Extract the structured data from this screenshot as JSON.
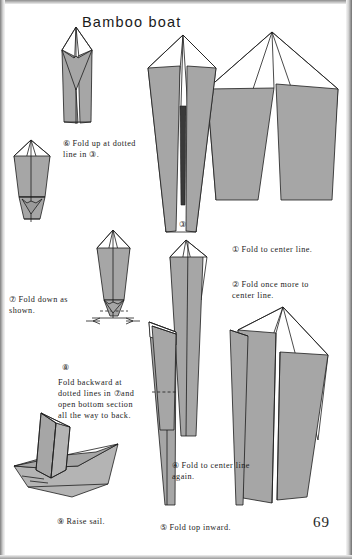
{
  "page": {
    "title": "Bamboo boat",
    "page_number": "69",
    "background_color": "#ffffff",
    "ink_color": "#1b1b1b",
    "paper_fill": "#a6a6a6"
  },
  "steps": [
    {
      "id": "1",
      "marker": "①",
      "label": "Fold to center line.",
      "caption_x": 232,
      "caption_y": 233
    },
    {
      "id": "2",
      "marker": "②",
      "label": "Fold once more to\n      center line.",
      "caption_x": 232,
      "caption_y": 268
    },
    {
      "id": "3",
      "marker": "③",
      "label": "",
      "caption_x": 179,
      "caption_y": 208
    },
    {
      "id": "4",
      "marker": "④",
      "label": "Fold to center line\n     again.",
      "caption_x": 172,
      "caption_y": 449
    },
    {
      "id": "5",
      "marker": "⑤",
      "label": "Fold top inward.",
      "caption_x": 160,
      "caption_y": 511
    },
    {
      "id": "6",
      "marker": "⑥",
      "label": "Fold up at dotted\n    line in ③.",
      "caption_x": 63,
      "caption_y": 127
    },
    {
      "id": "7",
      "marker": "⑦",
      "label": "Fold down as\n     shown.",
      "caption_x": 9,
      "caption_y": 283
    },
    {
      "id": "8",
      "marker": "⑧",
      "label": "",
      "caption_x": 62,
      "caption_y": 351
    },
    {
      "id": "8b",
      "marker": "",
      "label": "Fold  backward   at\ndotted lines in ⑦and\nopen  bottom  section\nall  the  way  to back.",
      "caption_x": 58,
      "caption_y": 366
    },
    {
      "id": "9",
      "marker": "⑨",
      "label": "Raise sail.",
      "caption_x": 57,
      "caption_y": 505
    }
  ],
  "figures": [
    {
      "name": "figure-step-1-kite",
      "description": "kite with two gray flaps folded to center line"
    },
    {
      "name": "figure-step-2-narrow-kite",
      "description": "narrower kite after second fold to center"
    },
    {
      "name": "figure-step-3-point",
      "description": "long narrow point with center seam and dotted fold line"
    },
    {
      "name": "figure-step-4-folded",
      "description": "tall narrow shape folded to center again"
    },
    {
      "name": "figure-step-5-top-inward",
      "description": "narrow shape with top folded inward"
    },
    {
      "name": "figure-step-6-up-fold",
      "description": "shape with bottom folded up at dotted line"
    },
    {
      "name": "figure-step-7-fold-down",
      "description": "shape with flaps folded down, arrows shown"
    },
    {
      "name": "figure-step-8-open",
      "description": "shape with dotted lines and opposing arrows for opening bottom"
    },
    {
      "name": "figure-step-9-boat",
      "description": "completed bamboo boat with raised sail"
    }
  ]
}
